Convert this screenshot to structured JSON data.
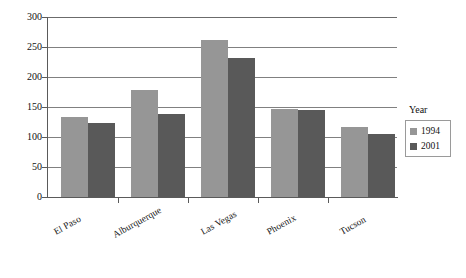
{
  "chart_data": {
    "type": "bar",
    "title": "",
    "xlabel": "",
    "ylabel": "",
    "ylim": [
      0,
      300
    ],
    "ytick_values": [
      0,
      50,
      100,
      150,
      200,
      250,
      300
    ],
    "ytick_labels": [
      "0",
      "50",
      "100",
      "150",
      "200",
      "250",
      "300"
    ],
    "grid": true,
    "legend_position": "right",
    "legend_title": "Year",
    "categories": [
      "El Paso",
      "Alburquerque",
      "Las Vegas",
      "Phoenix",
      "Tucson"
    ],
    "series": [
      {
        "name": "1994",
        "color": "#969696",
        "values": [
          134,
          178,
          262,
          146,
          116
        ]
      },
      {
        "name": "2001",
        "color": "#595959",
        "values": [
          124,
          138,
          232,
          145,
          105
        ]
      }
    ]
  },
  "axes": {
    "axis_color": "#5a5a5a",
    "gridline_color": "#808080"
  }
}
